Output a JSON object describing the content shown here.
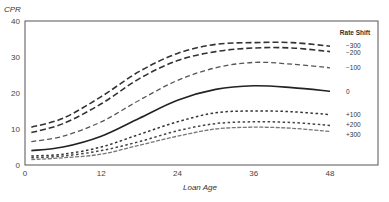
{
  "chart_data": {
    "type": "line",
    "title": "",
    "xlabel": "Loan Age",
    "ylabel": "CPR",
    "xlim": [
      0,
      52
    ],
    "ylim": [
      0,
      40
    ],
    "xticks": [
      0,
      12,
      24,
      36,
      48
    ],
    "yticks": [
      0,
      10,
      20,
      30,
      40
    ],
    "grid": false,
    "legend_title": "Rate Shift",
    "legend_position": "right (inline labels at line ends)",
    "x": [
      1,
      6,
      12,
      18,
      24,
      30,
      36,
      42,
      48
    ],
    "series": [
      {
        "name": "−300",
        "style": "long-dash",
        "color": "#333333",
        "values": [
          10.5,
          13,
          19,
          26,
          31,
          33.5,
          34,
          34,
          33
        ]
      },
      {
        "name": "−200",
        "style": "long-dash",
        "color": "#333333",
        "values": [
          9,
          11.5,
          17,
          24,
          29,
          31.5,
          32.5,
          32.5,
          31.5
        ]
      },
      {
        "name": "−100",
        "style": "dash",
        "color": "#555555",
        "values": [
          6.5,
          8,
          12,
          18,
          23.5,
          27,
          28.5,
          28,
          27
        ]
      },
      {
        "name": "0",
        "style": "solid",
        "color": "#222222",
        "values": [
          4,
          5,
          8,
          13,
          18,
          21,
          22,
          21.5,
          20.5
        ]
      },
      {
        "name": "+100",
        "style": "short-dash",
        "color": "#333333",
        "values": [
          2.5,
          3,
          5,
          8.5,
          12,
          14.5,
          15,
          14.8,
          14
        ]
      },
      {
        "name": "+200",
        "style": "short-dash",
        "color": "#444444",
        "values": [
          2,
          2.5,
          4,
          6.5,
          9.5,
          11.5,
          12,
          11.8,
          11
        ]
      },
      {
        "name": "+300",
        "style": "dash-dot",
        "color": "#777777",
        "values": [
          1.5,
          2,
          3,
          5.5,
          8,
          10,
          10.5,
          10.2,
          9.3
        ]
      }
    ]
  }
}
